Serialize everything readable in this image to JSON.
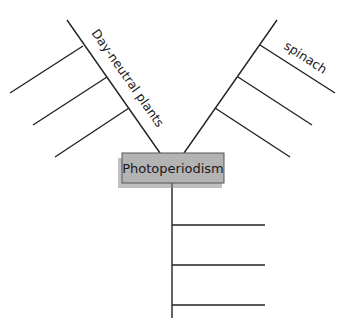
{
  "diagram": {
    "type": "spider-map",
    "center": {
      "label": "Photoperiodism",
      "fill": "#b3b3b3",
      "shadow": "#8a8a8a",
      "border": "#555555"
    },
    "legs": [
      {
        "id": "upper-left",
        "label": "Day-neutral plants",
        "branches": [
          "",
          "",
          ""
        ]
      },
      {
        "id": "upper-right",
        "label": "spinach",
        "branches": [
          "",
          "",
          ""
        ]
      },
      {
        "id": "bottom",
        "label": "",
        "branches": [
          "",
          "",
          ""
        ]
      }
    ]
  }
}
